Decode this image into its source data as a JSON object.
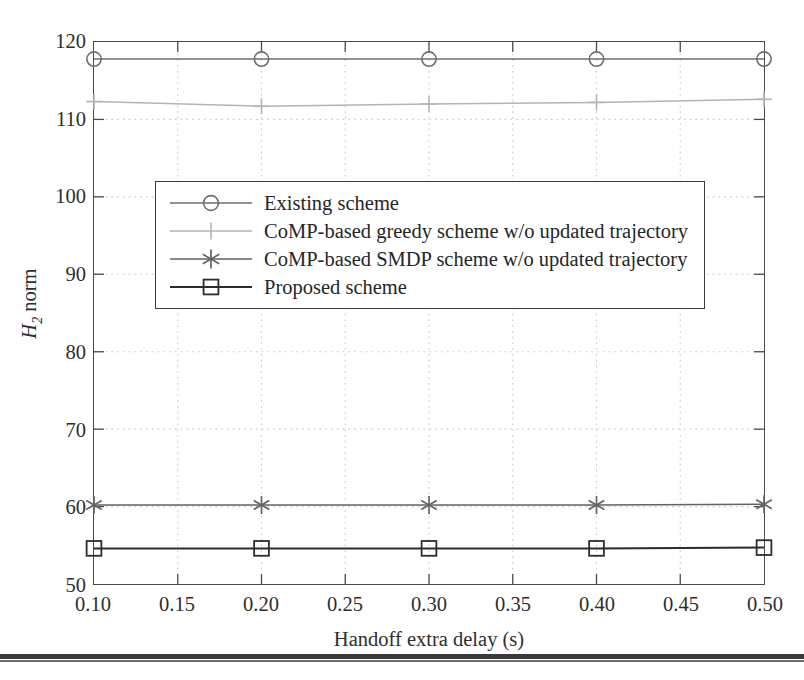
{
  "chart_data": {
    "type": "line",
    "title": "",
    "xlabel": "Handoff extra delay (s)",
    "ylabel": "H2 norm",
    "ylabel_html": "H<sub>2</sub> norm",
    "x": [
      0.1,
      0.2,
      0.3,
      0.4,
      0.5
    ],
    "xlim": [
      0.1,
      0.5
    ],
    "ylim": [
      50,
      120
    ],
    "xticks": [
      "0.10",
      "0.15",
      "0.20",
      "0.25",
      "0.30",
      "0.35",
      "0.40",
      "0.45",
      "0.50"
    ],
    "xtick_values": [
      0.1,
      0.15,
      0.2,
      0.25,
      0.3,
      0.35,
      0.4,
      0.45,
      0.5
    ],
    "yticks": [
      "50",
      "60",
      "70",
      "80",
      "90",
      "100",
      "110",
      "120"
    ],
    "ytick_values": [
      50,
      60,
      70,
      80,
      90,
      100,
      110,
      120
    ],
    "grid": true,
    "grid_style": "dotted",
    "legend_position": "upper center",
    "series": [
      {
        "name": "Existing scheme",
        "marker": "circle",
        "color": "#6e6e6e",
        "values": [
          117.8,
          117.8,
          117.8,
          117.8,
          117.8
        ]
      },
      {
        "name": "CoMP-based greedy scheme w/o updated trajectory",
        "marker": "plus",
        "color": "#b4b4b4",
        "values": [
          112.3,
          111.7,
          112.0,
          112.2,
          112.6
        ]
      },
      {
        "name": "CoMP-based SMDP scheme w/o updated trajectory",
        "marker": "asterisk",
        "color": "#636363",
        "values": [
          60.2,
          60.2,
          60.2,
          60.2,
          60.3
        ]
      },
      {
        "name": "Proposed scheme",
        "marker": "square",
        "color": "#2c2c2c",
        "values": [
          54.6,
          54.6,
          54.6,
          54.6,
          54.7
        ]
      }
    ]
  },
  "legend": {
    "items": [
      {
        "label": "Existing scheme",
        "marker": "circle-marker-icon"
      },
      {
        "label": "CoMP-based greedy scheme w/o updated trajectory",
        "marker": "plus-marker-icon"
      },
      {
        "label": "CoMP-based SMDP scheme w/o updated trajectory",
        "marker": "asterisk-marker-icon"
      },
      {
        "label": "Proposed scheme",
        "marker": "square-marker-icon"
      }
    ]
  },
  "colors": {
    "axis": "#4a4a4a",
    "grid": "#c9c9c9",
    "text": "#2e2e2e",
    "rule": "#3a3a3a"
  }
}
